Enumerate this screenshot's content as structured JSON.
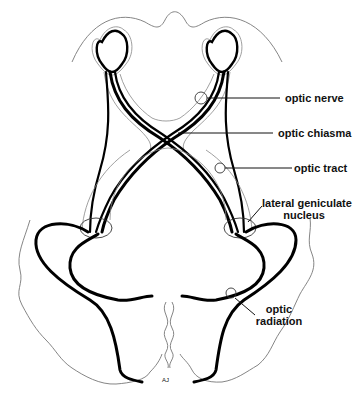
{
  "diagram": {
    "labels": [
      {
        "id": "optic_nerve",
        "text": "optic nerve"
      },
      {
        "id": "optic_chiasma",
        "text": "optic chiasma"
      },
      {
        "id": "optic_tract",
        "text": "optic tract"
      },
      {
        "id": "lateral_geniculate_nucleus",
        "line1": "lateral geniculate",
        "line2": "nucleus"
      },
      {
        "id": "optic_radiation",
        "line1": "optic",
        "line2": "radiation"
      }
    ],
    "signature": "AJ"
  }
}
